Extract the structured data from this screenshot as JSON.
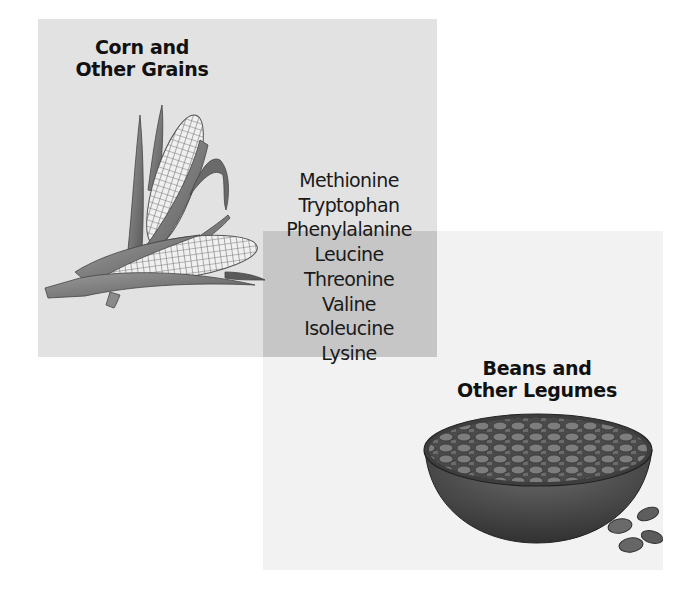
{
  "diagram": {
    "type": "overlapping-regions",
    "regions": [
      {
        "id": "grains",
        "title_line1": "Corn and",
        "title_line2": "Other Grains",
        "illustration": "corn-icon",
        "color": "#e2e2e2"
      },
      {
        "id": "legumes",
        "title_line1": "Beans and",
        "title_line2": "Other Legumes",
        "illustration": "bean-bowl-icon",
        "color": "#f2f2f2"
      }
    ],
    "overlap_color": "#c6c6c6",
    "amino_acids": [
      {
        "name": "Methionine",
        "region": "grains"
      },
      {
        "name": "Tryptophan",
        "region": "grains"
      },
      {
        "name": "Phenylalanine",
        "region": "both"
      },
      {
        "name": "Leucine",
        "region": "both"
      },
      {
        "name": "Threonine",
        "region": "both"
      },
      {
        "name": "Valine",
        "region": "both"
      },
      {
        "name": "Isoleucine",
        "region": "legumes"
      },
      {
        "name": "Lysine",
        "region": "legumes"
      }
    ]
  }
}
